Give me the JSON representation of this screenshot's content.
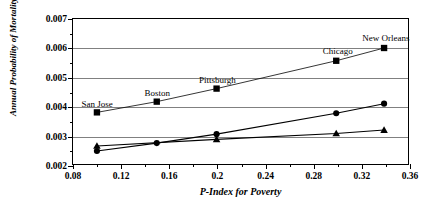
{
  "chart_data": {
    "type": "scatter",
    "title": "",
    "xlabel": "P-Index for Poverty",
    "ylabel": "Annual Probability of Mortality",
    "xlim": [
      0.08,
      0.36
    ],
    "ylim": [
      0.002,
      0.007
    ],
    "xticks": [
      "0.08",
      "0.12",
      "0.16",
      "0.2",
      "0.24",
      "0.28",
      "0.32",
      "0.36"
    ],
    "xtick_values": [
      0.08,
      0.12,
      0.16,
      0.2,
      0.24,
      0.28,
      0.32,
      0.36
    ],
    "xminor_values": [
      0.1,
      0.14,
      0.18,
      0.22,
      0.26,
      0.3,
      0.34
    ],
    "yticks": [
      "0.002",
      "0.003",
      "0.004",
      "0.005",
      "0.006",
      "0.007"
    ],
    "ytick_values": [
      0.002,
      0.003,
      0.004,
      0.005,
      0.006,
      0.007
    ],
    "yminor_values": [
      0.0025,
      0.0035,
      0.0045,
      0.0055,
      0.0065
    ],
    "grid": "horizontal",
    "legend": "none",
    "series": [
      {
        "name": "city-markers",
        "marker": "square",
        "x": [
          0.1,
          0.15,
          0.2,
          0.3,
          0.34
        ],
        "values": [
          0.00378,
          0.00415,
          0.0046,
          0.00556,
          0.006
        ],
        "point_labels": [
          "San Jose",
          "Boston",
          "Pittsburgh",
          "Chicago",
          "New Orleans"
        ]
      },
      {
        "name": "circle-series",
        "marker": "circle",
        "x": [
          0.1,
          0.15,
          0.2,
          0.3,
          0.34
        ],
        "values": [
          0.00245,
          0.00272,
          0.00303,
          0.00375,
          0.00408
        ],
        "point_labels": [
          "",
          "",
          "",
          "",
          ""
        ]
      },
      {
        "name": "triangle-series",
        "marker": "triangle",
        "x": [
          0.1,
          0.2,
          0.3,
          0.34
        ],
        "values": [
          0.00262,
          0.00285,
          0.00305,
          0.00317
        ],
        "point_labels": [
          "",
          "",
          "",
          ""
        ]
      }
    ],
    "annotations": [
      {
        "text": "San Jose",
        "x": 0.1,
        "y": 0.00378
      },
      {
        "text": "Boston",
        "x": 0.15,
        "y": 0.00415
      },
      {
        "text": "Pittsburgh",
        "x": 0.2,
        "y": 0.0046
      },
      {
        "text": "Chicago",
        "x": 0.3,
        "y": 0.00556
      },
      {
        "text": "New Orleans",
        "x": 0.34,
        "y": 0.006
      }
    ],
    "colors": {
      "marker": "#000000",
      "line": "#000000",
      "grid": "#808080",
      "frame": "#000000",
      "background": "#ffffff"
    }
  }
}
